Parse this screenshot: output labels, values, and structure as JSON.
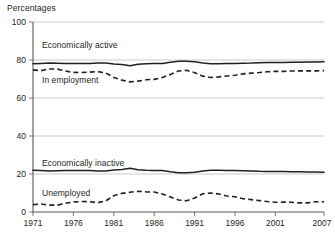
{
  "chart_data": {
    "type": "line",
    "title": "Percentages",
    "xlabel": "",
    "ylabel": "Percentages",
    "ylim": [
      0,
      100
    ],
    "yticks": [
      0,
      20,
      40,
      60,
      80,
      100
    ],
    "xlim": [
      1971,
      2007
    ],
    "xticks": [
      1971,
      1976,
      1981,
      1986,
      1991,
      1996,
      2001,
      2007
    ],
    "grid": true,
    "legend": "inline-labels",
    "x": [
      1971,
      1972,
      1973,
      1974,
      1975,
      1976,
      1977,
      1978,
      1979,
      1980,
      1981,
      1982,
      1983,
      1984,
      1985,
      1986,
      1987,
      1988,
      1989,
      1990,
      1991,
      1992,
      1993,
      1994,
      1995,
      1996,
      1997,
      1998,
      1999,
      2000,
      2001,
      2002,
      2003,
      2004,
      2005,
      2006,
      2007
    ],
    "series": [
      {
        "name": "Economically active",
        "style": "solid",
        "label": "Economically active",
        "values": [
          78.0,
          78.2,
          78.4,
          78.3,
          78.2,
          78.1,
          78.1,
          78.2,
          78.4,
          78.4,
          77.9,
          77.6,
          77.0,
          77.8,
          78.0,
          78.1,
          78.2,
          78.8,
          79.3,
          79.4,
          79.1,
          78.4,
          78.0,
          78.0,
          78.1,
          78.2,
          78.3,
          78.4,
          78.6,
          78.7,
          78.7,
          78.7,
          78.8,
          78.8,
          78.9,
          79.0,
          79.1
        ]
      },
      {
        "name": "In employment",
        "style": "dashed",
        "label": "In employment",
        "values": [
          74.8,
          74.4,
          75.3,
          75.2,
          74.2,
          73.5,
          73.4,
          73.6,
          73.9,
          73.2,
          70.8,
          69.4,
          68.5,
          68.9,
          69.6,
          69.8,
          70.8,
          72.4,
          74.2,
          74.6,
          73.3,
          71.5,
          70.8,
          71.1,
          71.6,
          72.0,
          72.7,
          73.1,
          73.4,
          73.8,
          74.0,
          74.0,
          74.2,
          74.3,
          74.3,
          74.3,
          74.4
        ]
      },
      {
        "name": "Economically inactive",
        "style": "solid",
        "label": "Economically inactive",
        "values": [
          22.0,
          21.8,
          21.6,
          21.7,
          21.8,
          21.9,
          21.9,
          21.8,
          21.6,
          21.6,
          22.1,
          22.4,
          23.0,
          22.2,
          22.0,
          21.9,
          21.8,
          21.2,
          20.7,
          20.6,
          20.9,
          21.6,
          22.0,
          22.0,
          21.9,
          21.8,
          21.7,
          21.6,
          21.4,
          21.3,
          21.3,
          21.3,
          21.2,
          21.2,
          21.1,
          21.0,
          20.9
        ]
      },
      {
        "name": "Unemployed",
        "style": "dashed",
        "label": "Unemployed",
        "values": [
          3.9,
          4.2,
          3.6,
          3.6,
          4.6,
          5.3,
          5.5,
          5.4,
          4.9,
          5.8,
          8.6,
          9.8,
          10.4,
          10.9,
          10.6,
          10.5,
          9.5,
          7.9,
          6.3,
          5.9,
          7.4,
          9.6,
          10.0,
          9.5,
          8.4,
          8.0,
          7.0,
          6.5,
          6.0,
          5.5,
          5.1,
          5.2,
          5.1,
          4.8,
          4.8,
          5.4,
          5.4
        ]
      }
    ]
  },
  "labels": {
    "chart_title": "Percentages",
    "ytick_0": "0",
    "ytick_20": "20",
    "ytick_40": "40",
    "ytick_60": "60",
    "ytick_80": "80",
    "ytick_100": "100",
    "xtick_1971": "1971",
    "xtick_1976": "1976",
    "xtick_1981": "1981",
    "xtick_1986": "1986",
    "xtick_1991": "1991",
    "xtick_1996": "1996",
    "xtick_2001": "2001",
    "xtick_2007": "2007",
    "series_economically_active": "Economically active",
    "series_in_employment": "In employment",
    "series_economically_inactive": "Economically inactive",
    "series_unemployed": "Unemployed"
  },
  "colors": {
    "line": "#231f20",
    "grid": "#b6b6b6",
    "axis": "#58585a",
    "background": "#ffffff"
  }
}
